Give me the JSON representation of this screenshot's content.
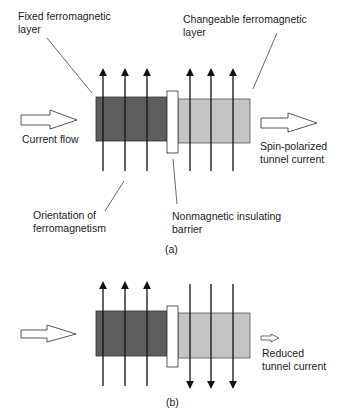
{
  "panel_a": {
    "caption": "(a)",
    "labels": {
      "fixed_layer": [
        "Fixed ferromagnetic",
        "layer"
      ],
      "changeable_layer": [
        "Changeable ferromagnetic",
        "layer"
      ],
      "current_flow": "Current flow",
      "spin_polarized": [
        "Spin-polarized",
        "tunnel current"
      ],
      "orientation": [
        "Orientation of",
        "ferromagnetism"
      ],
      "barrier": [
        "Nonmagnetic insulating",
        "barrier"
      ]
    },
    "magnetization": {
      "fixed": "up",
      "changeable": "up"
    }
  },
  "panel_b": {
    "caption": "(b)",
    "labels": {
      "reduced": [
        "Reduced",
        "tunnel current"
      ]
    },
    "magnetization": {
      "fixed": "up",
      "changeable": "down"
    }
  },
  "colors": {
    "fixed_layer": "#5e5e5e",
    "changeable_layer": "#c4c4c4",
    "barrier": "#ffffff",
    "stroke": "#222222"
  }
}
